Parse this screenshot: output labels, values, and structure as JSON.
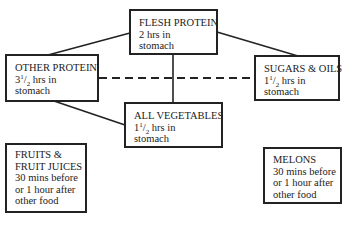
{
  "diagram": {
    "type": "food-combining digestion time chart",
    "boxes": [
      {
        "id": "flesh-protein",
        "title": "FLESH PROTEIN",
        "time_whole": "2",
        "time_frac_num": "",
        "time_frac_den": "",
        "time_rest": "hrs in",
        "detail": "stomach",
        "text": "FLESH PROTEIN 2 hrs in stomach"
      },
      {
        "id": "other-protein",
        "title": "OTHER PROTEIN",
        "time_whole": "3",
        "time_frac_num": "1",
        "time_frac_den": "2",
        "time_rest": "hrs in",
        "detail": "stomach",
        "text": "OTHER PROTEIN 3½ hrs in stomach"
      },
      {
        "id": "sugars-oils",
        "title": "SUGARS & OILS",
        "time_whole": "1",
        "time_frac_num": "1",
        "time_frac_den": "2",
        "time_rest": "hrs in",
        "detail": "stomach",
        "text": "SUGARS & OILS 1½ hrs in stomach"
      },
      {
        "id": "all-vegetables",
        "title": "ALL VEGETABLES",
        "time_whole": "1",
        "time_frac_num": "1",
        "time_frac_den": "2",
        "time_rest": "hrs in",
        "detail": "stomach",
        "text": "ALL VEGETABLES 1½ hrs in stomach"
      },
      {
        "id": "fruits",
        "lines": [
          "FRUITS &",
          "FRUIT JUICES",
          "30 mins before",
          "or 1 hour after",
          "other food"
        ]
      },
      {
        "id": "melons",
        "lines": [
          "MELONS",
          "30 mins before",
          "or 1 hour after",
          "other food"
        ]
      }
    ],
    "connections": [
      {
        "from": "flesh-protein",
        "to": "other-protein",
        "style": "solid"
      },
      {
        "from": "flesh-protein",
        "to": "sugars-oils",
        "style": "solid"
      },
      {
        "from": "flesh-protein",
        "to": "all-vegetables",
        "style": "solid"
      },
      {
        "from": "other-protein",
        "to": "all-vegetables",
        "style": "solid"
      },
      {
        "from": "other-protein",
        "to": "sugars-oils",
        "style": "dashed"
      }
    ],
    "colors": {
      "line": "#222222",
      "background": "#ffffff",
      "text": "#222222"
    }
  }
}
